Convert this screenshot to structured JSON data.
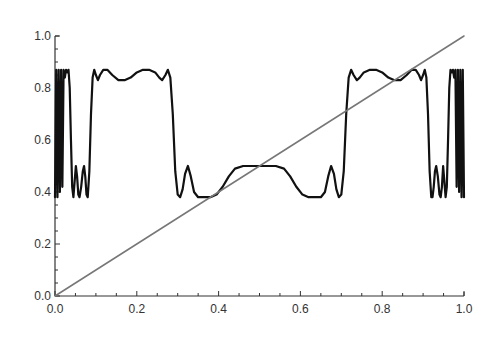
{
  "chart_data": {
    "type": "line",
    "title": "",
    "xlabel": "",
    "ylabel": "",
    "xlim": [
      0.0,
      1.0
    ],
    "ylim": [
      0.0,
      1.0
    ],
    "grid": false,
    "legend": null,
    "x_ticks": [
      "0.0",
      "0.2",
      "0.4",
      "0.6",
      "0.8",
      "1.0"
    ],
    "y_ticks": [
      "0.0",
      "0.2",
      "0.4",
      "0.6",
      "0.8",
      "1.0"
    ],
    "series": [
      {
        "name": "oscillating-curve",
        "color": "#111111",
        "points": [
          [
            0.0,
            0.38
          ],
          [
            0.003,
            0.87
          ],
          [
            0.006,
            0.38
          ],
          [
            0.009,
            0.87
          ],
          [
            0.012,
            0.4
          ],
          [
            0.015,
            0.87
          ],
          [
            0.018,
            0.42
          ],
          [
            0.021,
            0.87
          ],
          [
            0.024,
            0.84
          ],
          [
            0.027,
            0.87
          ],
          [
            0.03,
            0.86
          ],
          [
            0.033,
            0.87
          ],
          [
            0.036,
            0.8
          ],
          [
            0.039,
            0.6
          ],
          [
            0.042,
            0.42
          ],
          [
            0.045,
            0.38
          ],
          [
            0.048,
            0.44
          ],
          [
            0.051,
            0.5
          ],
          [
            0.054,
            0.46
          ],
          [
            0.057,
            0.39
          ],
          [
            0.06,
            0.38
          ],
          [
            0.064,
            0.42
          ],
          [
            0.068,
            0.48
          ],
          [
            0.071,
            0.5
          ],
          [
            0.074,
            0.46
          ],
          [
            0.077,
            0.39
          ],
          [
            0.08,
            0.38
          ],
          [
            0.084,
            0.48
          ],
          [
            0.088,
            0.7
          ],
          [
            0.092,
            0.84
          ],
          [
            0.096,
            0.87
          ],
          [
            0.1,
            0.85
          ],
          [
            0.105,
            0.83
          ],
          [
            0.11,
            0.85
          ],
          [
            0.118,
            0.87
          ],
          [
            0.128,
            0.87
          ],
          [
            0.14,
            0.85
          ],
          [
            0.155,
            0.83
          ],
          [
            0.17,
            0.83
          ],
          [
            0.185,
            0.84
          ],
          [
            0.2,
            0.86
          ],
          [
            0.215,
            0.87
          ],
          [
            0.23,
            0.87
          ],
          [
            0.245,
            0.86
          ],
          [
            0.255,
            0.84
          ],
          [
            0.262,
            0.83
          ],
          [
            0.27,
            0.85
          ],
          [
            0.276,
            0.87
          ],
          [
            0.282,
            0.84
          ],
          [
            0.288,
            0.7
          ],
          [
            0.294,
            0.48
          ],
          [
            0.3,
            0.39
          ],
          [
            0.306,
            0.38
          ],
          [
            0.312,
            0.41
          ],
          [
            0.318,
            0.47
          ],
          [
            0.325,
            0.5
          ],
          [
            0.332,
            0.46
          ],
          [
            0.34,
            0.4
          ],
          [
            0.35,
            0.38
          ],
          [
            0.365,
            0.38
          ],
          [
            0.38,
            0.38
          ],
          [
            0.395,
            0.39
          ],
          [
            0.41,
            0.42
          ],
          [
            0.425,
            0.46
          ],
          [
            0.44,
            0.49
          ],
          [
            0.46,
            0.5
          ],
          [
            0.48,
            0.5
          ],
          [
            0.5,
            0.5
          ],
          [
            0.52,
            0.5
          ],
          [
            0.54,
            0.5
          ],
          [
            0.56,
            0.49
          ],
          [
            0.575,
            0.46
          ],
          [
            0.59,
            0.42
          ],
          [
            0.605,
            0.39
          ],
          [
            0.62,
            0.38
          ],
          [
            0.635,
            0.38
          ],
          [
            0.65,
            0.38
          ],
          [
            0.66,
            0.4
          ],
          [
            0.668,
            0.46
          ],
          [
            0.675,
            0.5
          ],
          [
            0.682,
            0.47
          ],
          [
            0.688,
            0.41
          ],
          [
            0.694,
            0.38
          ],
          [
            0.7,
            0.39
          ],
          [
            0.706,
            0.48
          ],
          [
            0.712,
            0.7
          ],
          [
            0.718,
            0.84
          ],
          [
            0.724,
            0.87
          ],
          [
            0.73,
            0.85
          ],
          [
            0.738,
            0.83
          ],
          [
            0.745,
            0.84
          ],
          [
            0.755,
            0.86
          ],
          [
            0.77,
            0.87
          ],
          [
            0.785,
            0.87
          ],
          [
            0.8,
            0.86
          ],
          [
            0.815,
            0.84
          ],
          [
            0.83,
            0.83
          ],
          [
            0.845,
            0.83
          ],
          [
            0.86,
            0.85
          ],
          [
            0.872,
            0.87
          ],
          [
            0.882,
            0.87
          ],
          [
            0.89,
            0.85
          ],
          [
            0.895,
            0.83
          ],
          [
            0.9,
            0.85
          ],
          [
            0.904,
            0.87
          ],
          [
            0.908,
            0.84
          ],
          [
            0.912,
            0.7
          ],
          [
            0.916,
            0.48
          ],
          [
            0.92,
            0.38
          ],
          [
            0.923,
            0.38
          ],
          [
            0.926,
            0.42
          ],
          [
            0.929,
            0.48
          ],
          [
            0.932,
            0.5
          ],
          [
            0.936,
            0.46
          ],
          [
            0.94,
            0.39
          ],
          [
            0.943,
            0.38
          ],
          [
            0.946,
            0.42
          ],
          [
            0.949,
            0.5
          ],
          [
            0.952,
            0.44
          ],
          [
            0.955,
            0.38
          ],
          [
            0.958,
            0.42
          ],
          [
            0.961,
            0.6
          ],
          [
            0.964,
            0.8
          ],
          [
            0.967,
            0.87
          ],
          [
            0.97,
            0.86
          ],
          [
            0.973,
            0.87
          ],
          [
            0.976,
            0.84
          ],
          [
            0.979,
            0.87
          ],
          [
            0.982,
            0.42
          ],
          [
            0.985,
            0.87
          ],
          [
            0.988,
            0.4
          ],
          [
            0.991,
            0.87
          ],
          [
            0.994,
            0.38
          ],
          [
            0.997,
            0.87
          ],
          [
            1.0,
            0.38
          ]
        ]
      },
      {
        "name": "identity-line",
        "color": "#777777",
        "points": [
          [
            0.0,
            0.0
          ],
          [
            1.0,
            1.0
          ]
        ]
      }
    ]
  }
}
